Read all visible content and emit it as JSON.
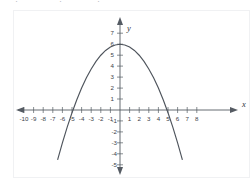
{
  "top_fragment": {
    "text": "—.—   —.—   —.—"
  },
  "figure": {
    "x_axis_label": "x",
    "y_axis_label": "y"
  },
  "chart_data": {
    "type": "line",
    "title": "",
    "subtitle": "",
    "xlabel": "x",
    "ylabel": "y",
    "xlim": [
      -10.5,
      8.5
    ],
    "ylim": [
      -5.5,
      7.5
    ],
    "grid": false,
    "legend": null,
    "axis_style": "cartesian-crosshair-with-arrows",
    "x_ticks": [
      -10,
      -9,
      -8,
      -7,
      -6,
      -5,
      -4,
      -3,
      -2,
      -1,
      1,
      2,
      3,
      4,
      5,
      6,
      7,
      8
    ],
    "x_tick_labels": [
      "-10",
      "-9",
      "-8",
      "-7",
      "-6",
      "-5",
      "-4",
      "-3",
      "-2",
      "-1",
      "1",
      "2",
      "3",
      "4",
      "5",
      "6",
      "7",
      "8"
    ],
    "y_ticks": [
      7,
      6,
      5,
      4,
      3,
      2,
      1,
      -1,
      -2,
      -3,
      -4,
      -5
    ],
    "y_tick_labels": [
      "7",
      "6",
      "5",
      "4",
      "3",
      "2",
      "1",
      "-1",
      "-2",
      "-3",
      "-4",
      "-5"
    ],
    "series": [
      {
        "name": "parabola",
        "type": "parabola",
        "orientation": "opens-down",
        "vertex": [
          0,
          6
        ],
        "roots": [
          -4.9,
          4.9
        ],
        "equation": "y = -0.25x^2 + 6",
        "color": "#4e545c",
        "x": [
          -7.0,
          -6.5,
          -6.0,
          -5.5,
          -5.0,
          -4.5,
          -4.0,
          -3.5,
          -3.0,
          -2.5,
          -2.0,
          -1.5,
          -1.0,
          -0.5,
          0.0,
          0.5,
          1.0,
          1.5,
          2.0,
          2.5,
          3.0,
          3.5,
          4.0,
          4.5,
          5.0,
          5.5,
          6.0,
          6.5,
          7.0
        ],
        "y": [
          -6.25,
          -4.56,
          -3.0,
          -1.56,
          -0.25,
          0.94,
          2.0,
          2.94,
          3.75,
          4.44,
          5.0,
          5.44,
          5.75,
          5.94,
          6.0,
          5.94,
          5.75,
          5.44,
          5.0,
          4.44,
          3.75,
          2.94,
          2.0,
          0.94,
          -0.25,
          -1.56,
          -3.0,
          -4.56,
          -6.25
        ]
      }
    ]
  }
}
